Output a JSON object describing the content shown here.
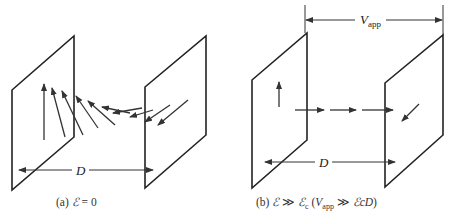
{
  "panels": [
    {
      "id": "a",
      "caption_prefix": "(a)",
      "caption_symbol": "ℰ",
      "caption_rest": " = 0",
      "dimension_label": "D",
      "description": "Two parallel plates; arrows rotate continuously from vertical at the left plate to pointing down-left at the right plate"
    },
    {
      "id": "b",
      "caption_prefix": "(b)",
      "caption_symbol": "ℰ",
      "caption_gg": " ≫ ",
      "caption_symbol2": "ℰ",
      "caption_sub2": "c",
      "caption_paren_open": " (",
      "caption_V": "V",
      "caption_Vsub": "app",
      "caption_gg2": " ≫ ",
      "caption_tail": "ℰcD",
      "caption_paren_close": ")",
      "dimension_label": "D",
      "voltage_label": "V",
      "voltage_sub": "app",
      "description": "Two parallel plates; arrow vertical at left plate, horizontal arrows between plates, down-left arrow at right plate"
    }
  ],
  "colors": {
    "line": "#222222",
    "background": "#ffffff"
  }
}
